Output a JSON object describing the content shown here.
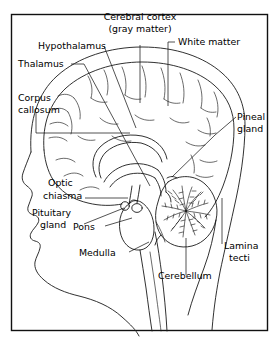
{
  "figure": {
    "type": "anatomical-diagram",
    "background_color": "#ffffff",
    "line_color": "#1a1a1a",
    "text_color": "#000000",
    "frame": {
      "x": 11,
      "y": 14,
      "width": 257,
      "height": 317
    }
  },
  "labels": {
    "cerebral_cortex_l1": "Cerebral cortex",
    "cerebral_cortex_l2": "(gray matter)",
    "hypothalamus": "Hypothalamus",
    "white_matter": "White matter",
    "thalamus": "Thalamus",
    "corpus_l1": "Corpus",
    "corpus_l2": "callosum",
    "pineal_l1": "Pineal",
    "pineal_l2": "gland",
    "optic_l1": "Optic",
    "optic_l2": "chiasma",
    "pituitary_l1": "Pituitary",
    "pituitary_l2": "gland",
    "pons": "Pons",
    "medulla": "Medulla",
    "cerebellum": "Cerebellum",
    "lamina_l1": "Lamina",
    "lamina_l2": "tecti"
  },
  "structures": [
    "head-profile",
    "skull-outline",
    "cerebral-cortex",
    "corpus-callosum",
    "lateral-ventricle",
    "thalamus",
    "hypothalamus",
    "optic-chiasma",
    "pituitary-gland",
    "pons",
    "medulla-oblongata",
    "spinal-cord",
    "cerebellum",
    "lamina-tecti",
    "pineal-gland"
  ]
}
